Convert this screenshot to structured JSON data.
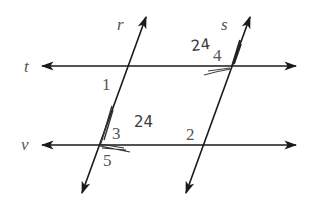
{
  "diagram": {
    "type": "geometry-parallel-lines",
    "lines": [
      {
        "name": "t",
        "kind": "horizontal",
        "label": "t"
      },
      {
        "name": "v",
        "kind": "horizontal",
        "label": "v"
      },
      {
        "name": "r",
        "kind": "transversal",
        "label": "r"
      },
      {
        "name": "s",
        "kind": "transversal",
        "label": "s"
      }
    ],
    "angles": [
      {
        "id": "1",
        "label": "1"
      },
      {
        "id": "2",
        "label": "2"
      },
      {
        "id": "3",
        "label": "3"
      },
      {
        "id": "4",
        "label": "4"
      },
      {
        "id": "5",
        "label": "5"
      }
    ],
    "annotations": [
      {
        "text": "24",
        "near": "angle 4"
      },
      {
        "text": "24",
        "near": "angle 3"
      }
    ],
    "colors": {
      "line": "#1a1a1a",
      "label": "#555555",
      "handwriting": "#3a3a3a"
    }
  }
}
